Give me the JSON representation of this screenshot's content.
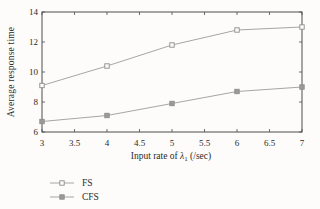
{
  "figure": {
    "background": "#fdfcfa",
    "axis_color": "#4d4d4d",
    "text_color": "#2b2b2b",
    "line_color": "#a6a6a6",
    "marker_stroke": "#8c8c8c",
    "marker_fill_open": "#fdfcfa",
    "marker_fill_solid": "#9a9a9a"
  },
  "chart_data": {
    "type": "line",
    "title": "",
    "xlabel_prefix": "Input rate of ",
    "xlabel_lambda": "λ",
    "xlabel_sub": "1",
    "xlabel_suffix": " (/sec)",
    "ylabel": "Average response time",
    "xlim": [
      3,
      7
    ],
    "ylim": [
      6,
      14
    ],
    "grid": false,
    "box": true,
    "legend_position": "bottom-left-outside",
    "x": [
      3,
      4,
      5,
      6,
      7
    ],
    "xticks": [
      3,
      3.5,
      4,
      4.5,
      5,
      5.5,
      6,
      6.5,
      7
    ],
    "xtick_labels": [
      "3",
      "3.5",
      "4",
      "4.5",
      "5",
      "5.5",
      "6",
      "6.5",
      "7"
    ],
    "yticks": [
      6,
      8,
      10,
      12,
      14
    ],
    "ytick_labels": [
      "6",
      "8",
      "10",
      "12",
      "14"
    ],
    "series": [
      {
        "name": "FS",
        "marker": "open-square",
        "values": [
          9.1,
          10.4,
          11.8,
          12.8,
          13.0
        ]
      },
      {
        "name": "CFS",
        "marker": "filled-square",
        "values": [
          6.7,
          7.1,
          7.9,
          8.7,
          9.0
        ]
      }
    ]
  }
}
